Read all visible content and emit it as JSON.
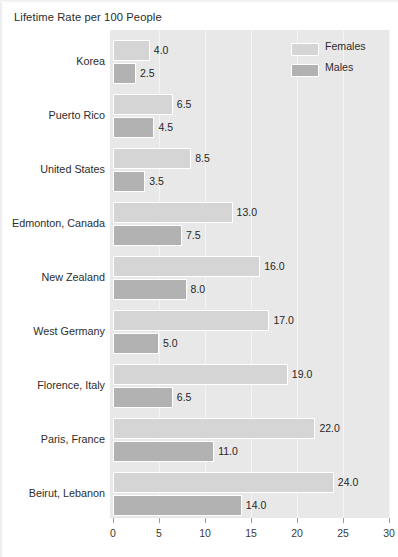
{
  "chart_data": {
    "type": "bar",
    "orientation": "horizontal",
    "title": "Lifetime Rate per 100 People",
    "xlabel": "",
    "ylabel": "",
    "xlim": [
      0,
      30
    ],
    "xticks": [
      0,
      5,
      10,
      15,
      20,
      25,
      30
    ],
    "xtick_labels": [
      "0",
      "5",
      "10",
      "15",
      "20",
      "25",
      "30"
    ],
    "grid": true,
    "grid_axis": "x",
    "legend_position": "top-right",
    "categories": [
      "Korea",
      "Puerto Rico",
      "United States",
      "Edmonton, Canada",
      "New Zealand",
      "West Germany",
      "Florence, Italy",
      "Paris, France",
      "Beirut, Lebanon"
    ],
    "series": [
      {
        "name": "Females",
        "color": "#d5d5d5",
        "values": [
          4.0,
          6.5,
          8.5,
          13.0,
          16.0,
          17.0,
          19.0,
          22.0,
          24.0
        ],
        "value_labels": [
          "4.0",
          "6.5",
          "8.5",
          "13.0",
          "16.0",
          "17.0",
          "19.0",
          "22.0",
          "24.0"
        ]
      },
      {
        "name": "Males",
        "color": "#b2b2b2",
        "values": [
          2.5,
          4.5,
          3.5,
          7.5,
          8.0,
          5.0,
          6.5,
          11.0,
          14.0
        ],
        "value_labels": [
          "2.5",
          "4.5",
          "3.5",
          "7.5",
          "8.0",
          "5.0",
          "6.5",
          "11.0",
          "14.0"
        ]
      }
    ]
  },
  "legend": {
    "items": [
      {
        "label": "Females",
        "swatch": "female"
      },
      {
        "label": "Males",
        "swatch": "male"
      }
    ]
  },
  "colors": {
    "female_bar": "#d5d5d5",
    "male_bar": "#b2b2b2",
    "plot_background": "#e8e8e8",
    "gridline": "#f4f4f4",
    "text": "#2d2d2d"
  }
}
